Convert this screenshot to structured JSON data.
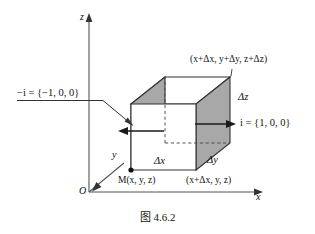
{
  "figure": {
    "caption": "图 4.6.2",
    "axes": {
      "z_label": "z",
      "y_label": "y",
      "x_label": "x",
      "origin_label": "O"
    },
    "vectors": {
      "left_normal": "−i = {−1, 0, 0}",
      "left_normal_symbol": "−i",
      "left_normal_value": "= {−1, 0, 0}",
      "right_normal": "i = {1, 0, 0}",
      "right_normal_symbol": "i",
      "right_normal_value": "= {1, 0, 0}"
    },
    "points": {
      "origin_corner": "M(x, y, z)",
      "far_corner": "(x+Δx, y+Δy, z+Δz)",
      "x_corner": "(x+Δx, y, z)"
    },
    "dimensions": {
      "dx": "Δx",
      "dy": "Δy",
      "dz": "Δz"
    },
    "colors": {
      "stroke": "#333333",
      "face_shade": "#a8a8a8",
      "face_light": "#ffffff",
      "text": "#121212"
    }
  }
}
